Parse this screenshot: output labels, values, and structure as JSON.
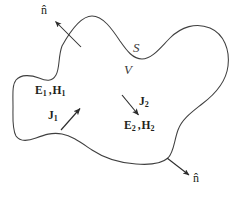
{
  "figure": {
    "type": "diagram",
    "background_color": "#ffffff",
    "stroke_color": "#3f3f3f",
    "text_color": "#231f20",
    "italic_text_color": "#3a3a3a",
    "labels": {
      "normal_top": "n̂",
      "normal_bottom": "n̂",
      "surface": "S",
      "volume": "V",
      "fields_1_E": "E",
      "fields_1_sub1": "1",
      "fields_1_comma": ",",
      "fields_1_H": "H",
      "fields_1_sub2": "1",
      "current_1": "J",
      "current_1_sub": "1",
      "current_2": "J",
      "current_2_sub": "2",
      "fields_2_E": "E",
      "fields_2_sub1": "2",
      "fields_2_comma": ",",
      "fields_2_H": "H",
      "fields_2_sub2": "2"
    },
    "arrows": [
      {
        "name": "normal-arrow-top",
        "from": [
          81,
          47
        ],
        "to": [
          53,
          19
        ],
        "points_to": "n̂"
      },
      {
        "name": "current-arrow-j1",
        "from": [
          62,
          130
        ],
        "to": [
          82,
          107
        ],
        "points_to": "J1 direction"
      },
      {
        "name": "current-arrow-j2",
        "from": [
          122,
          95
        ],
        "to": [
          140,
          117
        ],
        "points_to": "J2 direction"
      },
      {
        "name": "normal-arrow-bottom",
        "from": [
          167,
          158
        ],
        "to": [
          191,
          176
        ],
        "points_to": "n̂"
      }
    ]
  }
}
